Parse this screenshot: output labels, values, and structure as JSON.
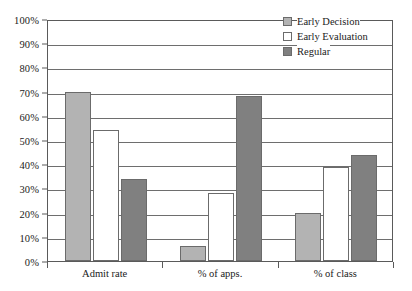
{
  "chart_data": {
    "type": "bar",
    "title": "",
    "subtitle": "",
    "xlabel": "",
    "ylabel": "",
    "ylim": [
      0,
      100
    ],
    "y_unit": "%",
    "grid": true,
    "legend_position": "top-right",
    "categories": [
      "Admit rate",
      "% of apps.",
      "% of class"
    ],
    "y_ticks": [
      "0%",
      "10%",
      "20%",
      "30%",
      "40%",
      "50%",
      "60%",
      "70%",
      "80%",
      "90%",
      "100%"
    ],
    "y_tick_values": [
      0,
      10,
      20,
      30,
      40,
      50,
      60,
      70,
      80,
      90,
      100
    ],
    "series": [
      {
        "name": "Early Decision",
        "color": "#b3b3b3",
        "values": [
          70,
          6,
          20
        ]
      },
      {
        "name": "Early Evaluation",
        "color": "#ffffff",
        "values": [
          54,
          28,
          39
        ]
      },
      {
        "name": "Regular",
        "color": "#808080",
        "values": [
          34,
          68,
          44
        ]
      }
    ]
  },
  "legend": {
    "items": [
      {
        "label": "Early Decision",
        "swatch": "#b3b3b3"
      },
      {
        "label": "Early Evaluation",
        "swatch": "#ffffff"
      },
      {
        "label": "Regular",
        "swatch": "#808080"
      }
    ]
  },
  "colors": {
    "axis": "#5a5a5a",
    "gridline": "#6e6e6e",
    "bar_outline": "#6b6b6b",
    "background": "#ffffff",
    "text": "#1a1a1a"
  }
}
